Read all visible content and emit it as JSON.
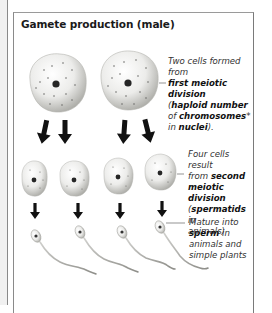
{
  "diagram": {
    "title": "Gamete production (male)",
    "stages": [
      {
        "name": "first-meiotic-division",
        "caption": {
          "line1": "Two cells formed from",
          "line2_bold": "first meiotic division",
          "line3_pre": "(",
          "line3_bold": "haploid number",
          "line4_pre": "of ",
          "line4_bold": "chromosomes",
          "line4_post": "*",
          "line5_pre": "in ",
          "line5_bold": "nuclei",
          "line5_post": ")."
        }
      },
      {
        "name": "second-meiotic-division",
        "caption": {
          "line1": "Four cells result",
          "line2_pre": "from ",
          "line2_bold": "second",
          "line3_bold": "meiotic division",
          "line4_pre": "(",
          "line4_bold": "spermatids",
          "line4_post": " in",
          "line5": "animals)"
        }
      },
      {
        "name": "maturation",
        "caption": {
          "line1": "Mature into",
          "line2_bold": "sperm",
          "line2_post": " in",
          "line3": "animals and",
          "line4": "simple plants"
        }
      }
    ],
    "colors": {
      "cell_fill": "#e9e9e6",
      "cell_shade": "#b9b9b4",
      "nucleus": "#2a2a2a",
      "arrow": "#111111",
      "border": "#8a8a8a"
    }
  }
}
